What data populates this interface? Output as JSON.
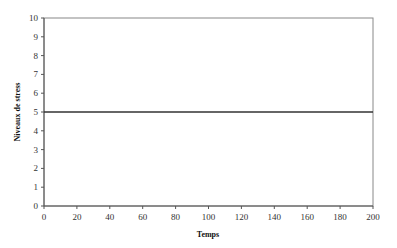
{
  "chart_data": {
    "type": "line",
    "title": "",
    "xlabel": "Temps",
    "ylabel": "Niveaux de stress",
    "xlim": [
      0,
      200
    ],
    "ylim": [
      0,
      10
    ],
    "x_ticks": [
      0,
      20,
      40,
      60,
      80,
      100,
      120,
      140,
      160,
      180,
      200
    ],
    "y_ticks": [
      0,
      1,
      2,
      3,
      4,
      5,
      6,
      7,
      8,
      9,
      10
    ],
    "grid": false,
    "legend": null,
    "series": [
      {
        "name": "Niveaux de stress",
        "x": [
          0,
          200
        ],
        "y": [
          5,
          5
        ],
        "color": "#333333"
      }
    ]
  }
}
